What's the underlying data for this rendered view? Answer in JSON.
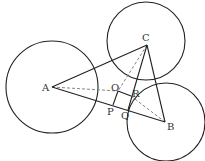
{
  "diagram": {
    "type": "geometry",
    "points": {
      "A": {
        "label": "A",
        "x": 52,
        "y": 87,
        "lx": 42,
        "ly": 91
      },
      "B": {
        "label": "B",
        "x": 165,
        "y": 122,
        "lx": 167,
        "ly": 130
      },
      "C": {
        "label": "C",
        "x": 147,
        "y": 45,
        "lx": 142,
        "ly": 41
      },
      "O": {
        "label": "O",
        "x": 118,
        "y": 91,
        "lx": 111,
        "ly": 91
      },
      "R": {
        "label": "R",
        "x": 131,
        "y": 96,
        "lx": 132,
        "ly": 97
      },
      "P": {
        "label": "P",
        "x": 113,
        "y": 105,
        "lx": 107,
        "ly": 115
      },
      "Q": {
        "label": "Q",
        "x": 128,
        "y": 110,
        "lx": 121,
        "ly": 119
      }
    },
    "circles": [
      {
        "name": "circle-a",
        "cx": 52,
        "cy": 87,
        "r": 46
      },
      {
        "name": "circle-c",
        "cx": 146,
        "cy": 41,
        "r": 39
      },
      {
        "name": "circle-b",
        "cx": 166,
        "cy": 122,
        "r": 39
      }
    ],
    "solid_segments": [
      {
        "name": "side-ac",
        "from": "A",
        "to": "C"
      },
      {
        "name": "side-cb",
        "from": "C",
        "to": "B"
      },
      {
        "name": "side-ab",
        "from": "A",
        "to": "B"
      },
      {
        "name": "segment-or",
        "from": "O",
        "to": "R"
      },
      {
        "name": "segment-op",
        "from": "O",
        "to": "P"
      },
      {
        "name": "segment-cq",
        "from": "C",
        "to": "Q"
      }
    ],
    "dashed_segments": [
      {
        "name": "dashed-ao",
        "from": "A",
        "to": "O"
      },
      {
        "name": "dashed-rb",
        "from": "R",
        "to": "B"
      },
      {
        "name": "dashed-co",
        "from": "C",
        "to": "O"
      }
    ],
    "colors": {
      "stroke": "#222222",
      "dashed": "#777777",
      "label": "#333333"
    }
  }
}
